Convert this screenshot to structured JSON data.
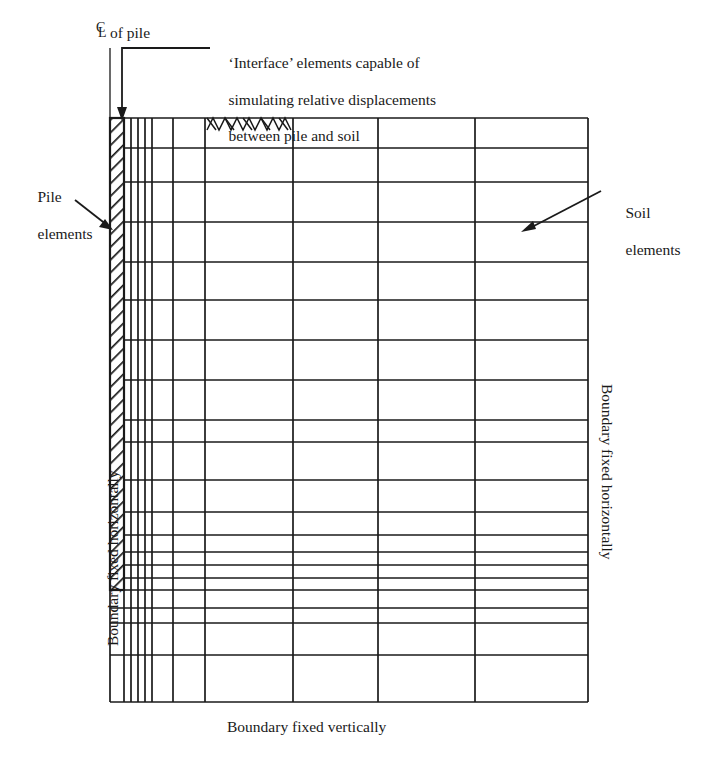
{
  "figure": {
    "type": "finite-element-mesh-diagram"
  },
  "labels": {
    "centerline_symbol": "C̲L",
    "centerline_c": "C",
    "centerline_l": "L",
    "centerline_text": "of pile",
    "interface_note_line1": "‘Interface’ elements capable of",
    "interface_note_line2": "simulating relative displacements",
    "interface_note_line3": "between pile and soil",
    "pile_elements_line1": "Pile",
    "pile_elements_line2": "elements",
    "soil_elements_line1": "Soil",
    "soil_elements_line2": "elements",
    "boundary_left": "Boundary fixed horizontally",
    "boundary_right": "Boundary fixed horizontally",
    "boundary_bottom": "Boundary fixed vertically"
  },
  "colors": {
    "line": "#1a1a1a",
    "background": "#ffffff",
    "text": "#1a1a1a"
  },
  "mesh": {
    "left": 110,
    "right": 588,
    "top": 118,
    "bottom": 702,
    "vertical_lines": [
      110,
      124,
      131,
      138,
      145,
      152,
      173,
      205,
      293,
      378,
      475,
      588
    ],
    "horizontal_lines": [
      118,
      148,
      182,
      222,
      262,
      300,
      340,
      380,
      420,
      442,
      480,
      512,
      535,
      552,
      565,
      578,
      590,
      608,
      623,
      655,
      702
    ],
    "pile": {
      "x_left": 110,
      "x_right": 124,
      "y_top": 118,
      "y_bottom": 590,
      "hatch": "diagonal"
    },
    "interface_marker": {
      "x_left": 205,
      "x_right": 293,
      "y_top": 118,
      "y_bottom": 130,
      "pattern": "zigzag"
    }
  },
  "annotations": {
    "centerline": {
      "x": 110,
      "y_top": 48,
      "y_bottom": 118
    },
    "interface_leader": {
      "x_elbow": 122,
      "y_top": 48,
      "x_end": 210,
      "y_arrow": 118
    },
    "pile_arrow": {
      "x1": 75,
      "y1": 200,
      "x2": 112,
      "y2": 228
    },
    "soil_arrow": {
      "x1": 600,
      "y1": 192,
      "x2": 523,
      "y2": 232
    }
  }
}
